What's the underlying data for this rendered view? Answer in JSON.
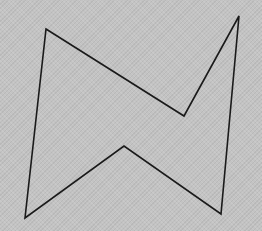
{
  "figure": {
    "width": 262,
    "height": 231,
    "background_color": "#c3c3c3",
    "stroke_color": "#1a1a1a",
    "stroke_width": 1.6
  },
  "shape": {
    "type": "polygon",
    "description": "closed six-vertex non-convex outline (bow-tie / lightning shape)",
    "vertices": [
      {
        "x": 46,
        "y": 29
      },
      {
        "x": 184,
        "y": 116
      },
      {
        "x": 239,
        "y": 16
      },
      {
        "x": 221,
        "y": 214
      },
      {
        "x": 124,
        "y": 146
      },
      {
        "x": 25,
        "y": 218
      }
    ]
  }
}
